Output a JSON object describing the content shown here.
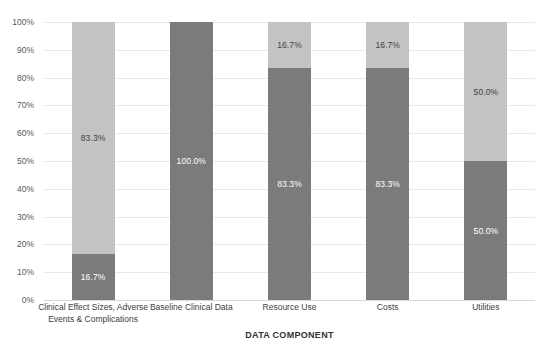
{
  "chart_data": {
    "type": "bar",
    "stacked": true,
    "title": "",
    "xlabel": "DATA COMPONENT",
    "ylabel": "",
    "ylim": [
      0,
      100
    ],
    "ytick_labels": [
      "100%",
      "90%",
      "80%",
      "70%",
      "60%",
      "50%",
      "40%",
      "30%",
      "20%",
      "10%",
      "0%"
    ],
    "ytick_values": [
      100,
      90,
      80,
      70,
      60,
      50,
      40,
      30,
      20,
      10,
      0
    ],
    "grid": true,
    "legend": "none",
    "categories": [
      "Clinical Effect Sizes, Adverse Events & Complications",
      "Baseline Clinical Data",
      "Resource Use",
      "Costs",
      "Utilities"
    ],
    "category_lines": [
      [
        "Clinical Effect Sizes, Adverse",
        "Events & Complications"
      ],
      [
        "Baseline Clinical Data"
      ],
      [
        "Resource Use"
      ],
      [
        "Costs"
      ],
      [
        "Utilities"
      ]
    ],
    "series": [
      {
        "name": "Lower segment",
        "color": "#7b7b7b",
        "values": [
          16.7,
          100.0,
          83.3,
          83.3,
          50.0
        ],
        "labels": [
          "16.7%",
          "100.0%",
          "83.3%",
          "83.3%",
          "50.0%"
        ]
      },
      {
        "name": "Upper segment",
        "color": "#c3c3c3",
        "values": [
          83.3,
          0.0,
          16.7,
          16.7,
          50.0
        ],
        "labels": [
          "83.3%",
          "",
          "16.7%",
          "16.7%",
          "50.0%"
        ]
      }
    ]
  },
  "colors": {
    "dark_gray": "#7b7b7b",
    "light_gray": "#c3c3c3",
    "gridline": "#e8e8e8",
    "axis_text": "#595959",
    "category_text": "#404040",
    "axis_title_text": "#333333",
    "background": "#ffffff"
  }
}
